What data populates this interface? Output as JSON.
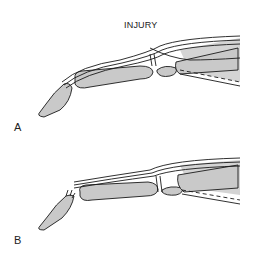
{
  "figure": {
    "title": "INJURY",
    "panels": [
      {
        "label": "A"
      },
      {
        "label": "B"
      }
    ]
  },
  "colors": {
    "bone_fill": "#c9c9c9",
    "line": "#1a1a1a",
    "background": "#ffffff"
  }
}
